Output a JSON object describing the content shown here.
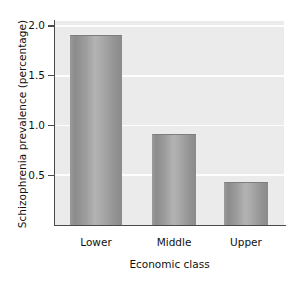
{
  "chart_data": {
    "type": "bar",
    "title": "",
    "categories": [
      "Lower",
      "Middle",
      "Upper"
    ],
    "values": [
      1.9,
      0.9,
      0.42
    ],
    "xlabel": "Economic class",
    "ylabel": "Schizophrenia prevalence (percentage)",
    "ylim": [
      0,
      2.05
    ],
    "yticks": [
      0.5,
      1.0,
      1.5,
      2.0
    ],
    "ytick_labels": [
      "0.5",
      "1.0",
      "1.5",
      "2.0"
    ],
    "grid": true,
    "gridline_color": "#fdfdfd",
    "plot_background": "#ebebeb",
    "bar_color": "#9a9a9a",
    "axis_color": "#4a4a4a",
    "legend": null,
    "legend_position": "none"
  },
  "figure": {
    "background": "#ffffff"
  }
}
